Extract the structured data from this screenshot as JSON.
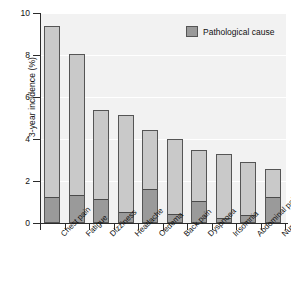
{
  "chart_data": {
    "type": "bar",
    "title": "",
    "subtitle": "",
    "xlabel": "",
    "ylabel": "3-year incidence (%)",
    "ylim": [
      0,
      10
    ],
    "yticks": [
      0,
      2,
      4,
      6,
      8,
      10
    ],
    "ytick_labels": [
      "0",
      "2",
      "4",
      "6",
      "8",
      "10"
    ],
    "grid": true,
    "grid_axis": "y",
    "stacked": true,
    "legend_position": "top-right",
    "categories": [
      "Chest pain",
      "Fatigue",
      "Dizziness",
      "Headache",
      "Oedema",
      "Back pain",
      "Dyspnoea",
      "Insomnia",
      "Abdominal pain",
      "Numbness"
    ],
    "series": [
      {
        "name": "Pathological cause",
        "color": "#9a9a9a",
        "values": [
          1.2,
          1.3,
          1.1,
          0.5,
          1.55,
          0.4,
          1.0,
          0.2,
          0.35,
          1.2
        ]
      },
      {
        "name": "Other cause",
        "color": "#c9c9c9",
        "values": [
          8.2,
          6.75,
          4.3,
          4.65,
          2.9,
          3.6,
          2.5,
          3.1,
          2.55,
          1.35
        ]
      }
    ],
    "totals": [
      9.4,
      8.05,
      5.4,
      5.15,
      4.45,
      4.0,
      3.5,
      3.3,
      2.9,
      2.55
    ]
  },
  "legend": {
    "entries": [
      {
        "label": "Pathological cause",
        "color": "#9a9a9a"
      }
    ]
  },
  "colors": {
    "plot_background": "#f2f2f2",
    "axis": "#2b2b2b",
    "gridline": "#ffffff",
    "bar_light": "#c9c9c9",
    "bar_dark": "#9a9a9a",
    "bar_outline": "#555555",
    "text": "#111111"
  }
}
